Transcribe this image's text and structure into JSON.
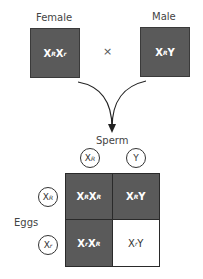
{
  "parents": {
    "female": {
      "label": "Female",
      "genotype_base1": "X",
      "allele1": "R",
      "genotype_base2": "X",
      "allele2": "r"
    },
    "male": {
      "label": "Male",
      "genotype_base1": "X",
      "allele1": "R",
      "genotype_base2": "Y"
    },
    "cross_symbol": "×"
  },
  "colors": {
    "dark_cell": "#5a5a5a",
    "light_cell": "#ffffff"
  },
  "punnett": {
    "sperm_label": "Sperm",
    "eggs_label": "Eggs",
    "sperm": [
      {
        "base": "X",
        "allele": "R"
      },
      {
        "base": "Y",
        "allele": ""
      }
    ],
    "eggs": [
      {
        "base": "X",
        "allele": "R"
      },
      {
        "base": "X",
        "allele": "r"
      }
    ],
    "cells": [
      {
        "a": "X",
        "a_sup": "R",
        "b": "X",
        "b_sup": "R",
        "shade": "dark"
      },
      {
        "a": "X",
        "a_sup": "R",
        "b": "Y",
        "b_sup": "",
        "shade": "dark"
      },
      {
        "a": "X",
        "a_sup": "r",
        "b": "X",
        "b_sup": "R",
        "shade": "dark"
      },
      {
        "a": "X",
        "a_sup": "r",
        "b": "Y",
        "b_sup": "",
        "shade": "light"
      }
    ]
  }
}
